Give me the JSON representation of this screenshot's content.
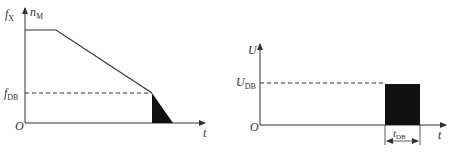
{
  "diagram": {
    "left_chart": {
      "y_axis_label": "f",
      "y_axis_label_sub": "X",
      "y_axis_label2": "n",
      "y_axis_label2_sub": "M",
      "x_axis_label": "t",
      "origin_label": "O",
      "level_label": "f",
      "level_label_sub": "DB",
      "curve_description": "constant speed then linear ramp down to f_DB, then DC braking region shaded"
    },
    "right_chart": {
      "y_axis_label": "U",
      "x_axis_label": "t",
      "origin_label": "O",
      "level_label": "U",
      "level_label_sub": "DB",
      "duration_label": "t",
      "duration_label_sub": "DB",
      "curve_description": "zero voltage until braking, then rectangular pulse of U_DB lasting t_DB"
    },
    "colors": {
      "line": "#333333",
      "fill": "#111111",
      "background": "#ffffff"
    }
  }
}
